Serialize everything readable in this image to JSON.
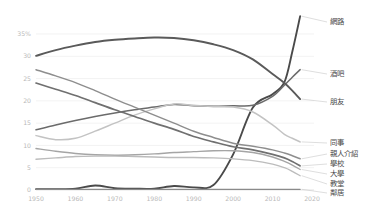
{
  "chart_data": {
    "type": "line",
    "title": "",
    "subtitle": "",
    "xlabel": "",
    "ylabel": "",
    "xlim": [
      1950,
      2020
    ],
    "ylim": [
      0,
      35
    ],
    "grid": true,
    "legend_position": "right-inline-labels",
    "y_ticks": [
      "0",
      "5",
      "10",
      "15",
      "20",
      "25",
      "30",
      "35%"
    ],
    "y_tick_values": [
      0,
      5,
      10,
      15,
      20,
      25,
      30,
      35
    ],
    "x_ticks": [
      "1950",
      "1960",
      "1970",
      "1980",
      "1990",
      "2000",
      "2010",
      "2020"
    ],
    "x_tick_values": [
      1950,
      1960,
      1970,
      1980,
      1990,
      2000,
      2010,
      2020
    ],
    "x": [
      1950,
      1955,
      1960,
      1965,
      1970,
      1975,
      1980,
      1985,
      1990,
      1995,
      2000,
      2005,
      2010,
      2013,
      2015,
      2017
    ],
    "series": [
      {
        "name": "網路",
        "label": "網路",
        "color": "#4a4a4a",
        "width": 1.9,
        "label_x": 330,
        "label_y": 22,
        "values": [
          0.2,
          0.2,
          0.3,
          1.0,
          0.4,
          0.3,
          0.3,
          0.9,
          0.6,
          1.1,
          8.0,
          18.5,
          21.5,
          24.2,
          31.0,
          39.0
        ]
      },
      {
        "name": "酒吧",
        "label": "酒吧",
        "color": "#6b6b6b",
        "width": 1.5,
        "label_x": 330,
        "label_y": 74,
        "values": [
          13.5,
          14.6,
          15.6,
          16.5,
          17.3,
          18.0,
          18.6,
          19.2,
          18.9,
          18.8,
          18.9,
          19.0,
          21.0,
          23.5,
          25.3,
          27.0
        ]
      },
      {
        "name": "朋友",
        "label": "朋友",
        "color": "#5a5a5a",
        "width": 1.9,
        "label_x": 330,
        "label_y": 102,
        "values": [
          30.1,
          31.4,
          32.4,
          33.2,
          33.7,
          34.0,
          34.2,
          34.1,
          33.6,
          32.7,
          31.4,
          29.3,
          26.0,
          24.0,
          22.3,
          20.4
        ]
      },
      {
        "name": "同事",
        "label": "同事",
        "color": "#c3c3c3",
        "width": 1.5,
        "label_x": 330,
        "label_y": 143,
        "values": [
          12.2,
          11.3,
          11.6,
          13.2,
          15.0,
          16.8,
          18.2,
          19.3,
          19.0,
          18.7,
          18.6,
          17.5,
          14.6,
          12.5,
          11.6,
          10.8
        ]
      },
      {
        "name": "親人介紹",
        "label": "親人介紹",
        "color": "#8e8e8e",
        "width": 1.5,
        "label_x": 330,
        "label_y": 154,
        "values": [
          27.0,
          25.6,
          24.1,
          22.3,
          20.4,
          18.6,
          16.8,
          15.0,
          13.2,
          11.8,
          10.5,
          9.8,
          9.0,
          8.3,
          7.7,
          7.0
        ]
      },
      {
        "name": "學校",
        "label": "學校",
        "color": "#707070",
        "width": 1.7,
        "label_x": 330,
        "label_y": 164,
        "values": [
          24.0,
          22.6,
          21.2,
          19.6,
          18.0,
          16.5,
          15.0,
          13.6,
          12.0,
          10.8,
          9.7,
          9.0,
          8.0,
          7.2,
          6.4,
          5.4
        ]
      },
      {
        "name": "大學",
        "label": "大學",
        "color": "#a5a5a5",
        "width": 1.4,
        "label_x": 330,
        "label_y": 174,
        "values": [
          9.3,
          8.7,
          8.2,
          7.9,
          7.8,
          7.9,
          8.1,
          8.4,
          8.6,
          8.8,
          8.8,
          8.4,
          7.4,
          6.4,
          5.6,
          4.6
        ]
      },
      {
        "name": "教堂",
        "label": "教堂",
        "color": "#bcbcbc",
        "width": 1.4,
        "label_x": 330,
        "label_y": 184,
        "values": [
          6.9,
          7.2,
          7.5,
          7.6,
          7.6,
          7.5,
          7.4,
          7.3,
          7.3,
          7.2,
          7.0,
          6.6,
          5.8,
          5.0,
          4.2,
          3.2
        ]
      },
      {
        "name": "鄰居",
        "label": "鄰居",
        "color": "#8a8a8a",
        "width": 1.3,
        "label_x": 330,
        "label_y": 193,
        "values": [
          0.15,
          0.15,
          0.15,
          0.15,
          0.15,
          0.15,
          0.15,
          0.15,
          0.15,
          0.15,
          0.15,
          0.15,
          0.15,
          0.15,
          0.15,
          0.15
        ]
      }
    ]
  },
  "colors": {
    "background": "#ffffff",
    "grid": "#ececec",
    "axis": "#d8d8d8",
    "tick_text": "#b9b9b9",
    "label_text": "#4a4a4a"
  }
}
